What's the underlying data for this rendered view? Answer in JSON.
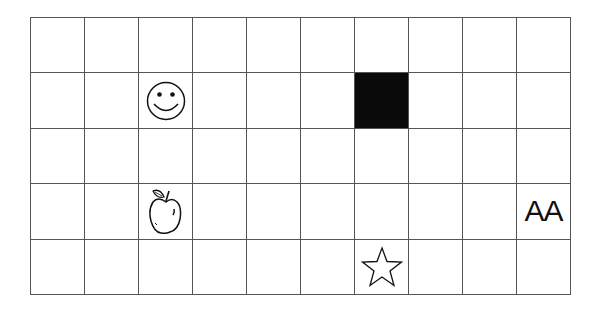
{
  "grid": {
    "columns": 10,
    "rows": 5,
    "line_color": "#555555",
    "fill_color": "#0a0a0a",
    "cells": [
      {
        "row": 1,
        "col": 2,
        "type": "icon",
        "icon": "smiley-face-icon"
      },
      {
        "row": 1,
        "col": 6,
        "type": "filled"
      },
      {
        "row": 3,
        "col": 2,
        "type": "icon",
        "icon": "apple-icon"
      },
      {
        "row": 3,
        "col": 9,
        "type": "text",
        "text": "AA"
      },
      {
        "row": 4,
        "col": 6,
        "type": "icon",
        "icon": "star-icon"
      }
    ]
  }
}
